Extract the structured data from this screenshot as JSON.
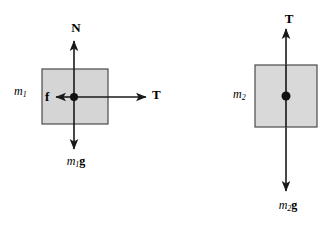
{
  "figure": {
    "kind": "free-body-diagram",
    "background_color": "#ffffff",
    "stroke_color": "#1a1a1a",
    "block_fill_color": "#d5d5d5",
    "block_stroke_color": "#4a4a4a"
  },
  "bodies": [
    {
      "id": "block-1",
      "mass_label": "m",
      "mass_subscript": "1",
      "block": {
        "x": 42,
        "y": 69,
        "width": 66,
        "height": 55
      },
      "center": {
        "x": 74,
        "y": 97
      },
      "mass_label_pos": {
        "x": 14,
        "y": 85
      },
      "forces": [
        {
          "id": "normal-force",
          "label": "N",
          "label_style": "bold-upright",
          "direction": "up",
          "tail": {
            "x": 74,
            "y": 97
          },
          "tip": {
            "x": 74,
            "y": 40
          },
          "label_pos": {
            "x": 76,
            "y": 21
          }
        },
        {
          "id": "friction-force",
          "label": "f",
          "label_style": "bold-upright",
          "direction": "left",
          "tail": {
            "x": 74,
            "y": 97
          },
          "tip": {
            "x": 55,
            "y": 97
          },
          "label_pos": {
            "x": 45,
            "y": 91
          }
        },
        {
          "id": "tension-force-1",
          "label": "T",
          "label_style": "bold-upright",
          "direction": "right",
          "tail": {
            "x": 74,
            "y": 97
          },
          "tip": {
            "x": 147,
            "y": 97
          },
          "label_pos": {
            "x": 152,
            "y": 88
          }
        },
        {
          "id": "weight-force-1",
          "label": "m",
          "label_subscript": "1",
          "label_bold_part": "g",
          "label_style": "italic-mass-bold-g",
          "direction": "down",
          "tail": {
            "x": 74,
            "y": 97
          },
          "tip": {
            "x": 74,
            "y": 150
          },
          "label_pos": {
            "x": 74,
            "y": 155
          }
        }
      ]
    },
    {
      "id": "block-2",
      "mass_label": "m",
      "mass_subscript": "2",
      "block": {
        "x": 255,
        "y": 65,
        "width": 62,
        "height": 62
      },
      "center": {
        "x": 286,
        "y": 96
      },
      "mass_label_pos": {
        "x": 233,
        "y": 88
      },
      "forces": [
        {
          "id": "tension-force-2",
          "label": "T",
          "label_style": "bold-upright",
          "direction": "up",
          "tail": {
            "x": 286,
            "y": 96
          },
          "tip": {
            "x": 286,
            "y": 28
          },
          "label_pos": {
            "x": 288,
            "y": 12
          }
        },
        {
          "id": "weight-force-2",
          "label": "m",
          "label_subscript": "2",
          "label_bold_part": "g",
          "label_style": "italic-mass-bold-g",
          "direction": "down",
          "tail": {
            "x": 286,
            "y": 96
          },
          "tip": {
            "x": 286,
            "y": 192
          },
          "label_pos": {
            "x": 286,
            "y": 199
          }
        }
      ]
    }
  ],
  "labels": {
    "block1_mass": "m",
    "block1_mass_sub": "1",
    "block2_mass": "m",
    "block2_mass_sub": "2",
    "normal": "N",
    "friction": "f",
    "tension_left": "T",
    "tension_right": "T",
    "weight1_m": "m",
    "weight1_sub": "1",
    "weight1_g": "g",
    "weight2_m": "m",
    "weight2_sub": "2",
    "weight2_g": "g"
  }
}
